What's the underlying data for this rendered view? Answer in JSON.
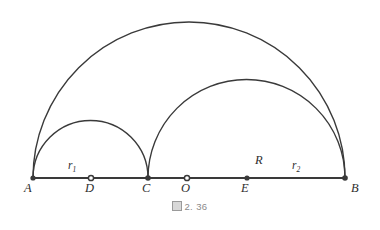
{
  "figure": {
    "caption_prefix_icon": "cjk-tofu-box-glyph",
    "caption_text": "2. 36",
    "background_color": "#ffffff",
    "stroke_color": "#3a3a3a",
    "baseline_color": "#3a3a3a"
  },
  "geometry": {
    "baseline": {
      "x1": 33,
      "y1": 178,
      "x2": 345,
      "y2": 178
    },
    "points": [
      {
        "id": "A",
        "label": "A",
        "x": 33,
        "y": 178,
        "label_x": 24,
        "label_y": 182
      },
      {
        "id": "D",
        "label": "D",
        "x": 91,
        "y": 178,
        "label_x": 85,
        "label_y": 182
      },
      {
        "id": "C",
        "label": "C",
        "x": 148,
        "y": 178,
        "label_x": 142,
        "label_y": 182
      },
      {
        "id": "O",
        "label": "O",
        "x": 187,
        "y": 178,
        "label_x": 181,
        "label_y": 182
      },
      {
        "id": "E",
        "label": "E",
        "x": 247,
        "y": 178,
        "label_x": 241,
        "label_y": 182
      },
      {
        "id": "B",
        "label": "B",
        "x": 345,
        "y": 178,
        "label_x": 351,
        "label_y": 182
      }
    ],
    "arcs": [
      {
        "id": "large-semicircle",
        "from": "A",
        "to": "B",
        "center": "O",
        "radius": 156,
        "x1": 33,
        "x2": 345,
        "y": 178
      },
      {
        "id": "medium-semicircle",
        "from": "C",
        "to": "B",
        "center": "E",
        "radius": 98.5,
        "x1": 148,
        "x2": 345,
        "y": 178
      },
      {
        "id": "small-semicircle",
        "from": "A",
        "to": "C",
        "center": "D",
        "radius": 57.5,
        "x1": 33,
        "x2": 148,
        "y": 178
      }
    ],
    "segment_labels": [
      {
        "id": "r1",
        "base": "r",
        "sub": "1",
        "x": 68,
        "y": 160,
        "style": "sub"
      },
      {
        "id": "R",
        "base": "R",
        "sub": "",
        "x": 255,
        "y": 154,
        "style": "cap"
      },
      {
        "id": "r2",
        "base": "r",
        "sub": "2",
        "x": 292,
        "y": 160,
        "style": "sub"
      }
    ]
  }
}
